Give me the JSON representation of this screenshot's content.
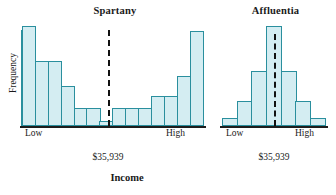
{
  "figure": {
    "xlabel": "Income",
    "ylabel": "Frequency"
  },
  "panels": {
    "left": {
      "title": "Spartany",
      "tick_low": "Low",
      "tick_high": "High",
      "median_caption": "$35,939"
    },
    "right": {
      "title": "Affluentia",
      "tick_low": "Low",
      "tick_high": "High",
      "median_caption": "$35,939"
    }
  },
  "colors": {
    "bar_fill": "#d4edf2",
    "bar_stroke": "#2a8f9e",
    "axis": "#1d1d1d",
    "median_line": "#111111",
    "text": "#1a1a1a"
  },
  "chart_data": [
    {
      "type": "bar",
      "title": "Spartany",
      "xlabel": "Income",
      "ylabel": "Frequency",
      "categories": [
        "1",
        "2",
        "3",
        "4",
        "5",
        "6",
        "7",
        "8",
        "9",
        "10",
        "11",
        "12",
        "13",
        "14"
      ],
      "tick_labels": {
        "first": "Low",
        "last": "High"
      },
      "values": [
        100,
        65,
        65,
        40,
        18,
        18,
        5,
        18,
        18,
        18,
        30,
        30,
        50,
        95
      ],
      "ylim": [
        0,
        100
      ],
      "grid": false,
      "legend": false,
      "annotations": [
        {
          "type": "vline",
          "label": "$35,939",
          "at_category_index": 6.5,
          "style": "dashed"
        }
      ],
      "shape": "bimodal U-shaped distribution"
    },
    {
      "type": "bar",
      "title": "Affluentia",
      "xlabel": "Income",
      "ylabel": "Frequency",
      "categories": [
        "1",
        "2",
        "3",
        "4",
        "5",
        "6",
        "7"
      ],
      "tick_labels": {
        "first": "Low",
        "last": "High"
      },
      "values": [
        8,
        25,
        55,
        100,
        55,
        25,
        8
      ],
      "ylim": [
        0,
        100
      ],
      "grid": false,
      "legend": false,
      "annotations": [
        {
          "type": "vline",
          "label": "$35,939",
          "at_category_index": 3.5,
          "style": "dashed"
        }
      ],
      "shape": "unimodal symmetric distribution"
    }
  ]
}
